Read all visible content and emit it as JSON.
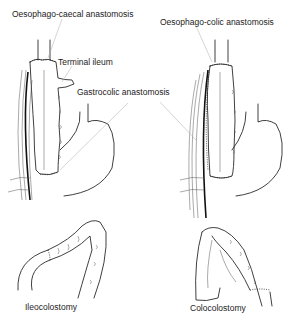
{
  "figure": {
    "labels": {
      "oesophago_caecal": "Oesophago-caecal anastomosis",
      "terminal_ileum": "Terminal ileum",
      "gastrocolic": "Gastrocolic anastomosis",
      "oesophago_colic": "Oesophago-colic anastomosis",
      "ileocolostomy": "Ileocolostomy",
      "colocolostomy": "Colocolostomy"
    },
    "panels": [
      {
        "id": "top-left",
        "subject": "Ileocolic interposition with oesophago-caecal anastomosis"
      },
      {
        "id": "top-right",
        "subject": "Colonic interposition with oesophago-colic anastomosis"
      },
      {
        "id": "bottom-left",
        "subject": "Ileocolostomy"
      },
      {
        "id": "bottom-right",
        "subject": "Colocolostomy"
      }
    ],
    "colors": {
      "ink": "#2a2a2a",
      "background": "#ffffff",
      "leader": "#aaaaaa"
    }
  }
}
